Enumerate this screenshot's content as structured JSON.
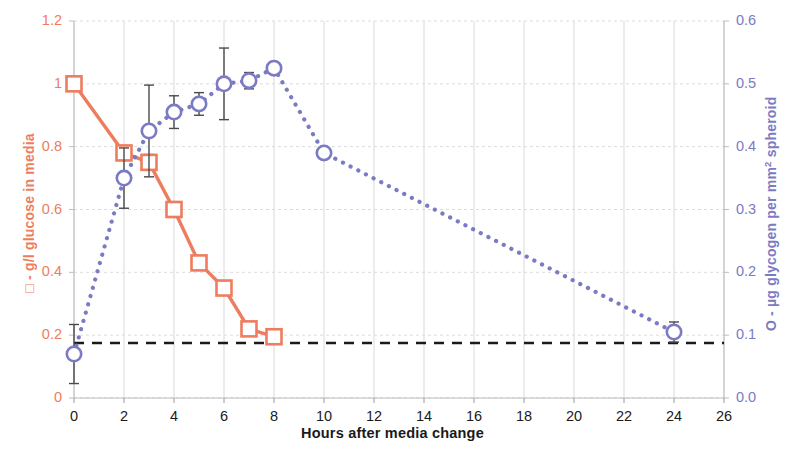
{
  "chart_data": {
    "type": "line",
    "title": "",
    "xlabel": "Hours after media change",
    "xlim": [
      0,
      26
    ],
    "xticks": [
      "0",
      "2",
      "4",
      "6",
      "8",
      "10",
      "12",
      "14",
      "16",
      "18",
      "20",
      "22",
      "24",
      "26"
    ],
    "xtick_values": [
      0,
      2,
      4,
      6,
      8,
      10,
      12,
      14,
      16,
      18,
      20,
      22,
      24,
      26
    ],
    "grid": true,
    "legend_position": "axis-titles",
    "axes": [
      {
        "id": "left",
        "label": "□ - g/l glucose in media",
        "marker": "open-square",
        "color": "#ED7D5E",
        "ylim": [
          0,
          1.2
        ],
        "yticks": [
          "0",
          "0.2",
          "0.4",
          "0.6",
          "0.8",
          "1",
          "1.2"
        ],
        "ytick_values": [
          0,
          0.2,
          0.4,
          0.6,
          0.8,
          1,
          1.2
        ]
      },
      {
        "id": "right",
        "label": "O - µg glycogen per mm² spheroid",
        "marker": "open-circle",
        "color": "#7B7BC4",
        "ylim": [
          0,
          0.6
        ],
        "yticks": [
          "0.0",
          "0.1",
          "0.2",
          "0.3",
          "0.4",
          "0.5",
          "0.6"
        ],
        "ytick_values": [
          0,
          0.1,
          0.2,
          0.3,
          0.4,
          0.5,
          0.6
        ]
      }
    ],
    "series": [
      {
        "name": "g/l glucose in media",
        "axis": "left",
        "color": "#ED7D5E",
        "marker": "open-square",
        "linestyle": "solid",
        "x": [
          0,
          2,
          3,
          4,
          5,
          6,
          7,
          8
        ],
        "values": [
          1.0,
          0.78,
          0.75,
          0.6,
          0.43,
          0.35,
          0.22,
          0.195
        ],
        "errors": [
          0,
          0.02,
          0.025,
          0.025,
          0.015,
          0.012,
          0.008,
          0.008
        ]
      },
      {
        "name": "µg glycogen per mm² spheroid",
        "axis": "right",
        "color": "#7B7BC4",
        "marker": "open-circle",
        "linestyle": "dotted",
        "x": [
          0,
          2,
          3,
          4,
          5,
          6,
          7,
          8,
          10,
          24
        ],
        "values": [
          0.07,
          0.35,
          0.425,
          0.455,
          0.468,
          0.5,
          0.505,
          0.525,
          0.39,
          0.105
        ],
        "errors": [
          0.047,
          0.048,
          0.073,
          0.026,
          0.018,
          0.057,
          0.013,
          0.0,
          0.0,
          0.016
        ]
      }
    ],
    "reference_line": {
      "name": "detection-threshold",
      "axis": "left",
      "value": 0.175,
      "color": "#1a1a1a",
      "linestyle": "dashed"
    }
  }
}
